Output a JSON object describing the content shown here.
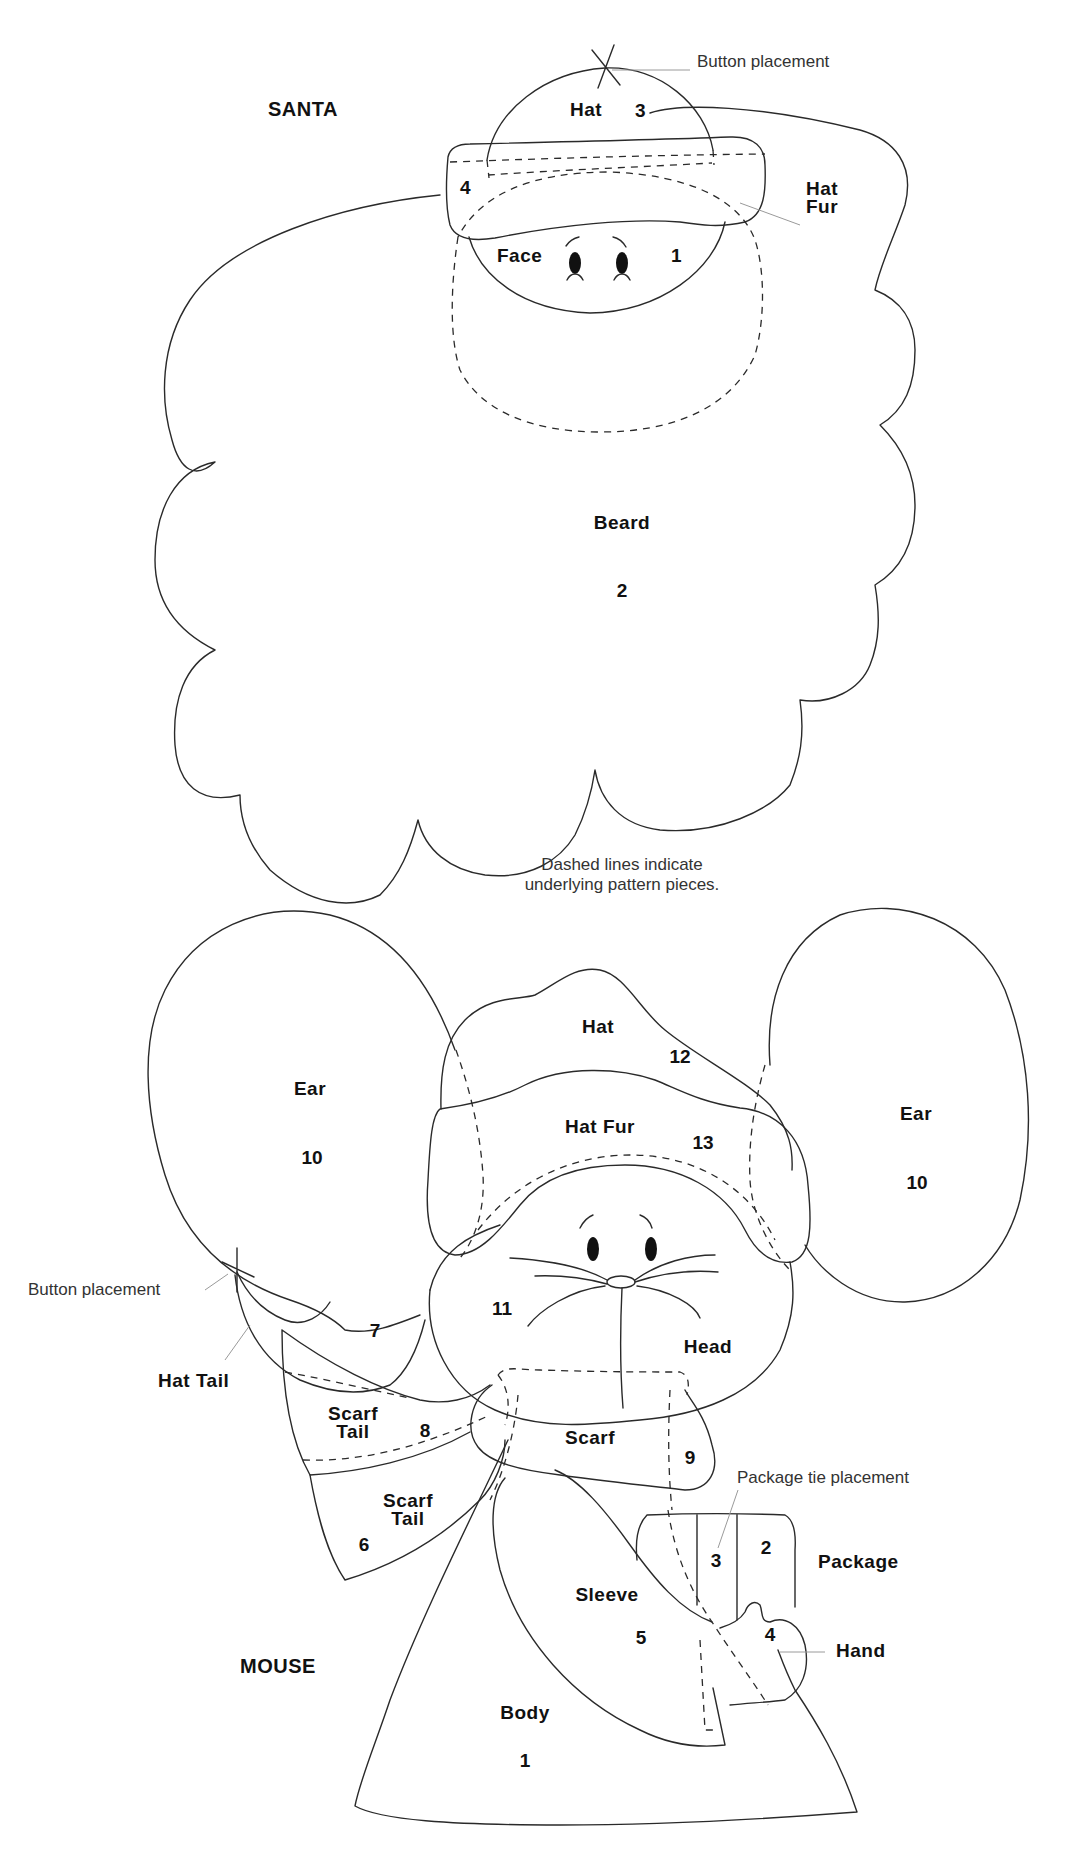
{
  "santa": {
    "title": "SANTA",
    "button_note": "Button placement",
    "pieces": {
      "hat": {
        "label": "Hat",
        "number": "3"
      },
      "hat_fur": {
        "label_line1": "Hat",
        "label_line2": "Fur",
        "number": "4"
      },
      "face": {
        "label": "Face",
        "number": "1"
      },
      "beard": {
        "label": "Beard",
        "number": "2"
      }
    }
  },
  "note": {
    "line1": "Dashed lines indicate",
    "line2": "underlying pattern pieces."
  },
  "mouse": {
    "title": "MOUSE",
    "button_note": "Button placement",
    "package_tie_note": "Package tie placement",
    "pieces": {
      "ear_left": {
        "label": "Ear",
        "number": "10"
      },
      "ear_right": {
        "label": "Ear",
        "number": "10"
      },
      "hat": {
        "label": "Hat",
        "number": "12"
      },
      "hat_fur": {
        "label": "Hat Fur",
        "number": "13"
      },
      "head": {
        "label": "Head",
        "number": "11"
      },
      "hat_tail": {
        "label": "Hat Tail",
        "number": "7"
      },
      "scarf_tail_upper": {
        "label_line1": "Scarf",
        "label_line2": "Tail",
        "number": "8"
      },
      "scarf": {
        "label": "Scarf",
        "number": "9"
      },
      "scarf_tail_lower": {
        "label_line1": "Scarf",
        "label_line2": "Tail",
        "number": "6"
      },
      "package": {
        "label": "Package",
        "number_left": "3",
        "number_right": "2"
      },
      "sleeve": {
        "label": "Sleeve",
        "number": "5"
      },
      "hand": {
        "label": "Hand",
        "number": "4"
      },
      "body": {
        "label": "Body",
        "number": "1"
      }
    }
  }
}
